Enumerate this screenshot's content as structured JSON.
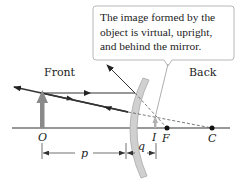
{
  "diagram": {
    "callout": {
      "lines": [
        "The image formed by the",
        "object is virtual, upright,",
        "and behind the mirror."
      ]
    },
    "regions": {
      "front": "Front",
      "back": "Back"
    },
    "points": {
      "object": "O",
      "image": "I",
      "focal": "F",
      "center": "C"
    },
    "distances": {
      "object_distance": "p",
      "image_distance": "q"
    },
    "colors": {
      "mirror_fill": "#d0d0d0",
      "mirror_edge": "#a8a8a8",
      "object_arrow": "#8a8a8a",
      "image_arrow": "#b0b0b0",
      "ray": "#333333",
      "callout_border": "#b8b8b8"
    }
  }
}
